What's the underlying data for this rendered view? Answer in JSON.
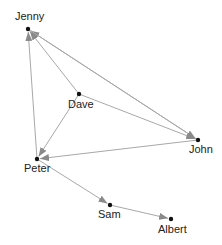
{
  "diagram": {
    "type": "directed-network",
    "edge_color": "#a8a8a8",
    "arrow_color": "#8a8a8a",
    "node_color": "#111111",
    "nodes": [
      {
        "id": "Jenny",
        "label": "Jenny",
        "x": 28,
        "y": 29,
        "lx": 15,
        "ly": 20
      },
      {
        "id": "Dave",
        "label": "Dave",
        "x": 79,
        "y": 94,
        "lx": 68,
        "ly": 108
      },
      {
        "id": "John",
        "label": "John",
        "x": 198,
        "y": 140,
        "lx": 189,
        "ly": 153
      },
      {
        "id": "Peter",
        "label": "Peter",
        "x": 37,
        "y": 159,
        "lx": 24,
        "ly": 172
      },
      {
        "id": "Sam",
        "label": "Sam",
        "x": 110,
        "y": 205,
        "lx": 98,
        "ly": 218
      },
      {
        "id": "Albert",
        "label": "Albert",
        "x": 171,
        "y": 219,
        "lx": 158,
        "ly": 233
      }
    ],
    "edges": [
      {
        "from": "Dave",
        "to": "Jenny"
      },
      {
        "from": "John",
        "to": "Jenny"
      },
      {
        "from": "Peter",
        "to": "Jenny"
      },
      {
        "from": "Jenny",
        "to": "John"
      },
      {
        "from": "Dave",
        "to": "John"
      },
      {
        "from": "Dave",
        "to": "Peter"
      },
      {
        "from": "John",
        "to": "Peter"
      },
      {
        "from": "Peter",
        "to": "Sam"
      },
      {
        "from": "Sam",
        "to": "Albert"
      }
    ]
  }
}
